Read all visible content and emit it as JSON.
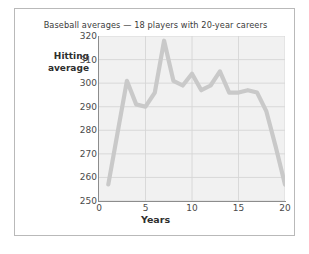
{
  "figure": {
    "title": "Baseball averages — 18 players with 20-year careers",
    "border_color": "#b9b9b9",
    "background": "#ffffff"
  },
  "axes": {
    "y_title_line1": "Hitting",
    "y_title_line2": "average",
    "x_title": "Years",
    "y_ticks": [
      "250",
      "260",
      "270",
      "280",
      "290",
      "300",
      "310",
      "320"
    ],
    "x_ticks": [
      "0",
      "5",
      "10",
      "15",
      "20"
    ]
  },
  "chart_data": {
    "type": "line",
    "title": "Baseball averages — 18 players with 20-year careers",
    "xlabel": "Years",
    "ylabel": "Hitting average",
    "xlim": [
      0,
      20
    ],
    "ylim": [
      250,
      320
    ],
    "grid": true,
    "legend": "none",
    "line_color": "#c9c9c9",
    "plot_background": "#f1f1f1",
    "gridline_color": "#d6d6d6",
    "x": [
      1,
      2,
      3,
      4,
      5,
      6,
      7,
      8,
      9,
      10,
      11,
      12,
      13,
      14,
      15,
      16,
      17,
      18,
      19,
      20
    ],
    "values": [
      257,
      279,
      301,
      291,
      290,
      296,
      318,
      301,
      299,
      304,
      297,
      299,
      305,
      296,
      296,
      297,
      296,
      288,
      273,
      257
    ],
    "series": [
      {
        "name": "Hitting average",
        "values": [
          257,
          279,
          301,
          291,
          290,
          296,
          318,
          301,
          299,
          304,
          297,
          299,
          305,
          296,
          296,
          297,
          296,
          288,
          273,
          257
        ]
      }
    ]
  }
}
